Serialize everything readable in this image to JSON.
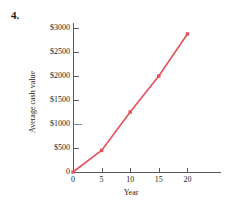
{
  "problem": {
    "number": "4."
  },
  "chart_data": {
    "type": "line",
    "title": "",
    "xlabel": "Year",
    "ylabel": "Average cash value",
    "x": [
      0,
      5,
      10,
      15,
      20
    ],
    "values": [
      0,
      450,
      1250,
      2000,
      2875
    ],
    "series": [
      {
        "name": "Average cash value",
        "values": [
          0,
          450,
          1250,
          2000,
          2875
        ]
      }
    ],
    "xlim": [
      0,
      26
    ],
    "ylim": [
      0,
      3100
    ],
    "x_ticks": [
      0,
      5,
      10,
      15,
      20
    ],
    "x_tick_labels": [
      "0",
      "5",
      "10",
      "15",
      "20"
    ],
    "y_ticks": [
      0,
      500,
      1000,
      1500,
      2000,
      2500,
      3000
    ],
    "y_tick_labels": [
      "0",
      "$500",
      "$1000",
      "$1500",
      "$2000",
      "$2500",
      "$3000"
    ],
    "grid": false,
    "legend": false,
    "marker": "square",
    "line_color": "#e8505b",
    "marker_color": "#e8505b",
    "axis_color": "#58595b",
    "highlight_tick_color": "#7b86c4",
    "highlight_tick_value": 1000
  }
}
